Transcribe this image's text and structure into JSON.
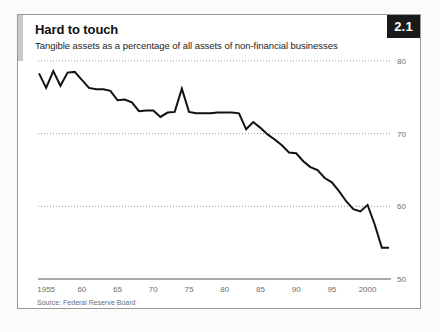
{
  "figure": {
    "badge": "2.1",
    "title": "Hard to touch",
    "subtitle": "Tangible assets as a percentage of all assets of non-financial businesses",
    "source": "Source: Federal Reserve Board",
    "colors": {
      "line": "#111111",
      "badge_bg": "#1a1a1a",
      "badge_text": "#ffffff",
      "accent_bar": "#c9c9c9",
      "gridline": "#9a9a9a",
      "axis": "#555555",
      "tick_text": "#6e6e6e",
      "frame": "#9a9a9a",
      "panel_bg": "#ffffff",
      "page_bg": "#fbfbfa"
    }
  },
  "chart_data": {
    "type": "line",
    "title": "Hard to touch",
    "subtitle": "Tangible assets as a percentage of all assets of non-financial businesses",
    "xlabel": "",
    "ylabel": "",
    "source": "Source: Federal Reserve Board",
    "xlim": [
      1954,
      2003
    ],
    "ylim": [
      50,
      80
    ],
    "yticks": [
      80,
      70,
      60,
      50
    ],
    "ytick_labels": [
      "80",
      "70",
      "60",
      "50"
    ],
    "xticks": [
      1955,
      1960,
      1965,
      1970,
      1975,
      1980,
      1985,
      1990,
      1995,
      2000
    ],
    "xtick_labels": [
      "1955",
      "60",
      "65",
      "70",
      "75",
      "80",
      "85",
      "90",
      "95",
      "2000"
    ],
    "grid": "horizontal-dotted",
    "legend": "none",
    "series": [
      {
        "name": "Tangible assets as % of all assets",
        "x": [
          1954,
          1955,
          1956,
          1957,
          1958,
          1959,
          1960,
          1961,
          1962,
          1963,
          1964,
          1965,
          1966,
          1967,
          1968,
          1969,
          1970,
          1971,
          1972,
          1973,
          1974,
          1975,
          1976,
          1977,
          1978,
          1979,
          1980,
          1981,
          1982,
          1983,
          1984,
          1985,
          1986,
          1987,
          1988,
          1989,
          1990,
          1991,
          1992,
          1993,
          1994,
          1995,
          1996,
          1997,
          1998,
          1999,
          2000,
          2001,
          2002,
          2003
        ],
        "y": [
          78.3,
          76.3,
          78.6,
          76.6,
          78.4,
          78.5,
          77.4,
          76.3,
          76.1,
          76.1,
          75.9,
          74.6,
          74.7,
          74.3,
          73.1,
          73.2,
          73.2,
          72.3,
          72.9,
          73.0,
          76.2,
          73.0,
          72.8,
          72.8,
          72.8,
          72.9,
          72.9,
          72.9,
          72.8,
          70.6,
          71.6,
          70.8,
          69.9,
          69.2,
          68.4,
          67.4,
          67.3,
          66.2,
          65.4,
          65.0,
          63.9,
          63.3,
          62.1,
          60.7,
          59.6,
          59.3,
          60.2,
          57.5,
          54.3,
          54.3
        ]
      }
    ]
  }
}
